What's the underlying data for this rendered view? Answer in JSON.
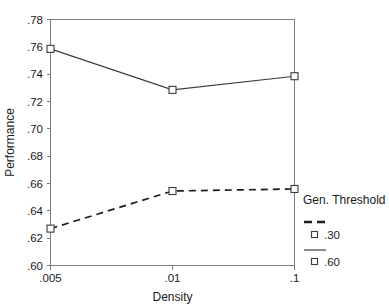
{
  "chart_data": {
    "type": "line",
    "title": "",
    "xlabel": "Density",
    "ylabel": "Performance",
    "categories": [
      ".005",
      ".01",
      ".1"
    ],
    "x_tick_labels": [
      ".005",
      ".01",
      ".1"
    ],
    "y_tick_labels": [
      ".60",
      ".62",
      ".64",
      ".66",
      ".68",
      ".70",
      ".72",
      ".74",
      ".76",
      ".78"
    ],
    "ylim": [
      0.6,
      0.78
    ],
    "y_tick_step": 0.02,
    "grid": false,
    "legend_position": "right",
    "legend_title": "Gen. Threshold",
    "marker": "open-square",
    "series": [
      {
        "name": ".30",
        "style": "dashed",
        "values": [
          0.627,
          0.6545,
          0.656
        ]
      },
      {
        "name": ".60",
        "style": "solid",
        "values": [
          0.7585,
          0.7285,
          0.7385
        ]
      }
    ]
  },
  "axes": {
    "y_title": "Performance",
    "x_title": "Density"
  },
  "legend": {
    "title": "Gen. Threshold",
    "entries": [
      {
        "label": ".30",
        "style": "dashed"
      },
      {
        "label": ".60",
        "style": "solid"
      }
    ]
  },
  "colors": {
    "frame": "#7d7d7d",
    "solid_series": "#3c3c3c",
    "dashed_series": "#1c1c1c",
    "text": "#1a1a1a",
    "background": "#ffffff"
  }
}
